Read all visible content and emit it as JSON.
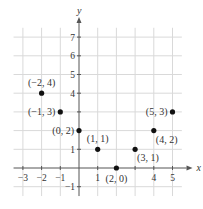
{
  "chart_data": {
    "type": "scatter",
    "title": "",
    "xlabel": "x",
    "ylabel": "y",
    "xlim": [
      -3,
      5
    ],
    "ylim": [
      -1,
      7
    ],
    "grid": true,
    "x_ticks": [
      -3,
      -2,
      -1,
      1,
      4,
      5
    ],
    "y_ticks": [
      -1,
      1,
      2,
      3,
      4,
      5,
      6,
      7
    ],
    "x_tick_labels": [
      "−3",
      "−2",
      "−1",
      "1",
      "4",
      "5"
    ],
    "y_tick_labels": [
      "−1",
      "1",
      "4",
      "5",
      "6",
      "7"
    ],
    "points": [
      {
        "x": -2,
        "y": 4,
        "label": "(−2, 4)",
        "label_pos": "above"
      },
      {
        "x": -1,
        "y": 3,
        "label": "(−1, 3)",
        "label_pos": "left"
      },
      {
        "x": 0,
        "y": 2,
        "label": "(0, 2)",
        "label_pos": "left"
      },
      {
        "x": 1,
        "y": 1,
        "label": "(1, 1)",
        "label_pos": "above"
      },
      {
        "x": 2,
        "y": 0,
        "label": "(2, 0)",
        "label_pos": "below"
      },
      {
        "x": 3,
        "y": 1,
        "label": "(3, 1)",
        "label_pos": "below-right"
      },
      {
        "x": 4,
        "y": 2,
        "label": "(4, 2)",
        "label_pos": "below-right"
      },
      {
        "x": 5,
        "y": 3,
        "label": "(5, 3)",
        "label_pos": "left"
      }
    ],
    "colors": {
      "grid": "#d9d9d9",
      "axis": "#555555",
      "point": "#111111",
      "text": "#333333"
    }
  }
}
